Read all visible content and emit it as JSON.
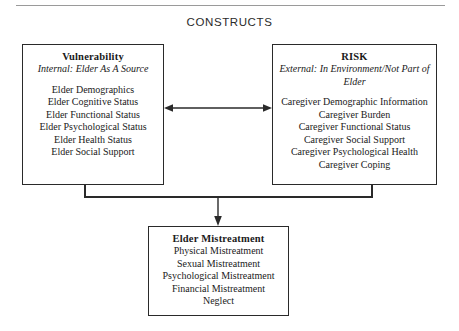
{
  "heading": "CONSTRUCTS",
  "boxes": {
    "vulnerability": {
      "title": "Vulnerability",
      "subtitle": "Internal: Elder As A Source",
      "items": [
        "Elder Demographics",
        "Elder Cognitive Status",
        "Elder Functional Status",
        "Elder Psychological Status",
        "Elder Health Status",
        "Elder Social Support"
      ]
    },
    "risk": {
      "title": "RISK",
      "subtitle": "External: In Environment/Not Part of Elder",
      "items": [
        "Caregiver Demographic Information",
        "Caregiver Burden",
        "Caregiver Functional Status",
        "Caregiver Social Support",
        "Caregiver Psychological Health",
        "Caregiver Coping"
      ]
    },
    "outcome": {
      "title": "Elder Mistreatment",
      "items": [
        "Physical Mistreatment",
        "Sexual Mistreatment",
        "Psychological Mistreatment",
        "Financial Mistreatment",
        "Neglect"
      ]
    }
  },
  "connectors": {
    "bidirectional_label": "vulnerability-risk-bidirectional-arrow",
    "outcome_label": "constructs-to-outcome-arrow"
  },
  "colors": {
    "line": "#2a2a2a",
    "rule": "#9a9a9a",
    "background": "#ffffff",
    "text": "#1a1a1a"
  }
}
